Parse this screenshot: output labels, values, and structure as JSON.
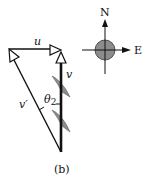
{
  "figure": {
    "caption": "(b)",
    "vectors": {
      "u": {
        "label": "u"
      },
      "v": {
        "label": "v"
      },
      "v_prime": {
        "label": "v′"
      }
    },
    "angle": {
      "symbol": "θ",
      "subscript": "2"
    },
    "compass": {
      "north": "N",
      "east": "E"
    }
  },
  "colors": {
    "line": "#111111",
    "fill_gray": "#8a8a8a",
    "background": "#ffffff"
  }
}
